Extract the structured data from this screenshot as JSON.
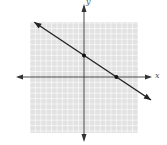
{
  "chart_data": {
    "type": "line",
    "title": "",
    "xlabel": "x",
    "ylabel": "y",
    "xlim": [
      -10,
      10
    ],
    "ylim": [
      -10,
      10
    ],
    "grid": true,
    "grid_step": 1,
    "series": [
      {
        "name": "line",
        "equation": "y = -2/3 x + 4",
        "points": [
          [
            0,
            4
          ],
          [
            6,
            0
          ]
        ],
        "x": [
          -10,
          0,
          6,
          10
        ],
        "y": [
          10.67,
          4,
          0,
          -2.67
        ]
      }
    ],
    "marked_points": [
      {
        "x": 0,
        "y": 4,
        "label": "y-intercept"
      },
      {
        "x": 6,
        "y": 0,
        "label": "x-intercept"
      }
    ]
  },
  "labels": {
    "x_axis": "x",
    "y_axis": "y"
  },
  "colors": {
    "grid_bg": "#e4e4e4",
    "grid_line": "#ffffff",
    "axis": "#333333",
    "line": "#222222"
  }
}
